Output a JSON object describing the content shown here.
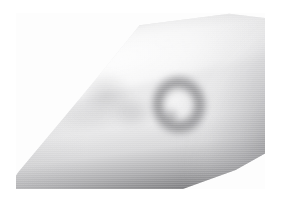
{
  "page": {
    "background_color": "#ffffff",
    "width": 285,
    "height": 214
  },
  "photo": {
    "caption": "",
    "alt_text": "Grayscale clinical photograph of a forearm showing a single annular skin lesion",
    "frame": {
      "left": 16,
      "top": 13,
      "width": 249,
      "height": 176,
      "background_color": "#fdfdfd"
    },
    "rendering": {
      "color_mode": "grayscale",
      "texture": "horizontal-scanlines",
      "focus": "soft"
    },
    "subject": {
      "body_part": "forearm",
      "orientation": "diagonal, elbow at upper right, wrist toward lower left",
      "skin_tone_range": [
        "#f7f7f7",
        "#b4b4b6",
        "#6a6a6d",
        "#323235"
      ]
    },
    "findings": [
      {
        "name": "annular-lesion",
        "shape": "annular ring",
        "position": {
          "center_x": 193,
          "center_y": 112
        },
        "size": {
          "width": 64,
          "height": 68
        },
        "ring_color": "#5a5a5e",
        "center_color": "#e2e2e3",
        "description": "well-demarcated ring with raised darker border and lighter central clearing"
      },
      {
        "name": "faint-macule-proximal",
        "shape": "ill-defined patch",
        "position": {
          "center_x": 100,
          "center_y": 88
        },
        "ring_color": "#9a9a9e",
        "description": "faint blotchy shading on proximal forearm"
      }
    ]
  }
}
